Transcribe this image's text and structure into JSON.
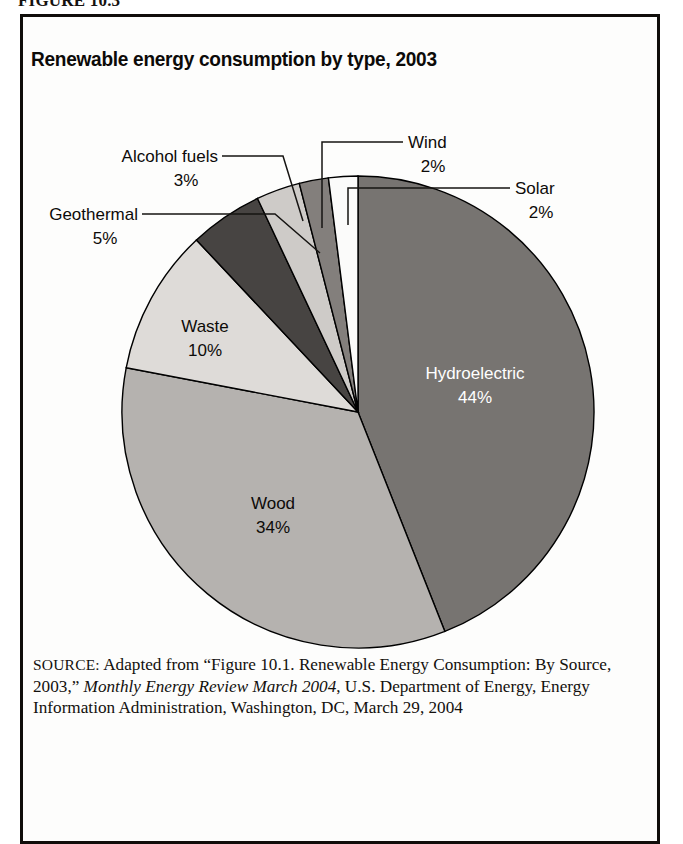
{
  "figure": {
    "caption": "FIGURE 10.3"
  },
  "chart_data": {
    "type": "pie",
    "title": "Renewable energy consumption by type, 2003",
    "xlabel": "",
    "ylabel": "",
    "units": "percent",
    "legend_position": "none",
    "grid": false,
    "categories": [
      "Hydroelectric",
      "Wood",
      "Waste",
      "Geothermal",
      "Alcohol fuels",
      "Wind",
      "Solar"
    ],
    "values": [
      44,
      34,
      10,
      5,
      3,
      2,
      2
    ],
    "labels": [
      {
        "name": "Hydroelectric",
        "percent": "44%",
        "value": 44,
        "placement": "inside",
        "fill": "#777471",
        "text_color": "#ffffff"
      },
      {
        "name": "Wood",
        "percent": "34%",
        "value": 34,
        "placement": "inside",
        "fill": "#b5b2af",
        "text_color": "#0d0b09"
      },
      {
        "name": "Waste",
        "percent": "10%",
        "value": 10,
        "placement": "inside",
        "fill": "#dedbd8",
        "text_color": "#0d0b09"
      },
      {
        "name": "Geothermal",
        "percent": "5%",
        "value": 5,
        "placement": "callout",
        "fill": "#474442",
        "text_color": "#0d0b09"
      },
      {
        "name": "Alcohol fuels",
        "percent": "3%",
        "value": 3,
        "placement": "callout",
        "fill": "#cecbc8",
        "text_color": "#0d0b09"
      },
      {
        "name": "Wind",
        "percent": "2%",
        "value": 2,
        "placement": "callout",
        "fill": "#837f7c",
        "text_color": "#0d0b09"
      },
      {
        "name": "Solar",
        "percent": "2%",
        "value": 2,
        "placement": "callout",
        "fill": "#fbfbfa",
        "text_color": "#0d0b09"
      }
    ],
    "start_angle_deg": 0,
    "direction": "clockwise"
  },
  "source": {
    "label": "SOURCE:",
    "text_part1": " Adapted from “Figure 10.1. Renewable Energy Consumption: By Source, 2003,” ",
    "italic_part": "Monthly Energy Review March 2004",
    "text_part2": ", U.S. Department of Energy, Energy Information Administration, Washington, DC, March 29, 2004"
  }
}
